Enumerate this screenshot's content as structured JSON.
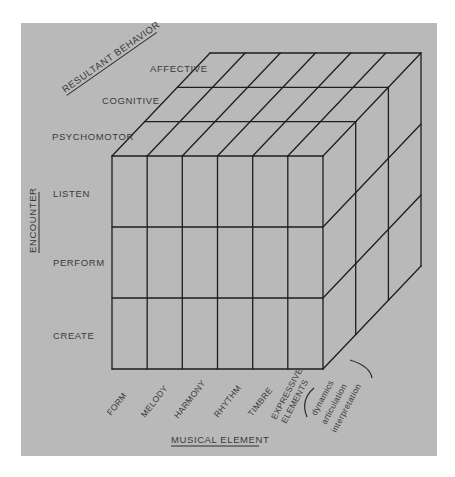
{
  "diagram": {
    "type": "3D cube model",
    "background_color": "#b9b9b9",
    "line_color": "#1e1e1e",
    "axes": {
      "resultant_behavior": {
        "title": "RESULTANT BEHAVIOR",
        "levels": [
          "PSYCHOMOTOR",
          "COGNITIVE",
          "AFFECTIVE"
        ]
      },
      "encounter": {
        "title": "ENCOUNTER",
        "levels": [
          "LISTEN",
          "PERFORM",
          "CREATE"
        ]
      },
      "musical_element": {
        "title": "MUSICAL ELEMENT",
        "levels": [
          "FORM",
          "MELODY",
          "HARMONY",
          "RHYTHM",
          "TIMBRE"
        ],
        "expressive": {
          "line1": "EXPRESSIVE",
          "line2": "ELEMENTS",
          "sub": [
            "dynamics",
            "articulation",
            "interpretation"
          ]
        }
      }
    }
  }
}
